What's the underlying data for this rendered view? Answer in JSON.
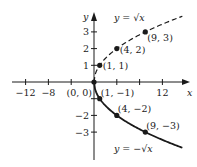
{
  "chart_data": {
    "type": "line",
    "title": "",
    "xlabel": "x",
    "ylabel": "y",
    "xlim": [
      -14,
      16
    ],
    "ylim": [
      -4.3,
      4.3
    ],
    "grid": false,
    "x_ticks": [
      -12,
      -8,
      -4,
      4,
      8,
      12
    ],
    "x_tick_labels": [
      "−12",
      "−8",
      "",
      "",
      "",
      "12"
    ],
    "y_ticks": [
      3,
      2,
      1,
      -1,
      -2,
      -3
    ],
    "y_tick_labels": [
      "3",
      "2",
      "1",
      "",
      "−2",
      "−3"
    ],
    "series": [
      {
        "name": "y = √x",
        "style": "dashed",
        "function": "sqrt",
        "domain": [
          0,
          15.5
        ],
        "label": "y = √x",
        "label_anchor_x": 3.5,
        "label_anchor_y": 3.85
      },
      {
        "name": "y = −√x",
        "style": "solid",
        "function": "neg_sqrt",
        "domain": [
          0,
          15.5
        ],
        "label": "y = −√x",
        "label_anchor_x": 3.5,
        "label_anchor_y": -4.0
      }
    ],
    "points": [
      {
        "x": 0,
        "y": 0,
        "label": "(0, 0)",
        "label_pos": "below-left"
      },
      {
        "x": 1,
        "y": 1,
        "label": "(1, 1)",
        "label_pos": "right"
      },
      {
        "x": 4,
        "y": 2,
        "label": "(4, 2)",
        "label_pos": "right"
      },
      {
        "x": 9,
        "y": 3,
        "label": "(9, 3)",
        "label_pos": "below-right"
      },
      {
        "x": 1,
        "y": -1,
        "label": "(1, −1)",
        "label_pos": "above-right"
      },
      {
        "x": 4,
        "y": -2,
        "label": "(4, −2)",
        "label_pos": "above-right"
      },
      {
        "x": 9,
        "y": -3,
        "label": "(9, −3)",
        "label_pos": "above-right"
      }
    ]
  }
}
